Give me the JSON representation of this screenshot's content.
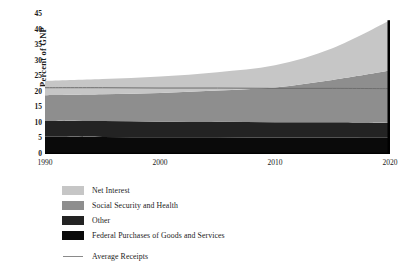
{
  "chart_data": {
    "type": "area",
    "stacked": true,
    "title": "",
    "xlabel": "",
    "ylabel": "Percent of GNP",
    "x": [
      1990,
      1995,
      2000,
      2005,
      2010,
      2015,
      2020
    ],
    "xlim": [
      1990,
      2020
    ],
    "ylim": [
      0,
      45
    ],
    "xticks": [
      "1990",
      "2000",
      "2010",
      "2020"
    ],
    "yticks": [
      "0",
      "5",
      "10",
      "15",
      "20",
      "25",
      "30",
      "35",
      "40",
      "45"
    ],
    "grid": false,
    "legend_position": "below",
    "series": [
      {
        "name": "Federal Purchases of Goods and Services",
        "color": "#0a0a0a",
        "values": [
          5.6,
          5.5,
          5.4,
          5.4,
          5.3,
          5.3,
          5.2
        ]
      },
      {
        "name": "Other",
        "color": "#232323",
        "values": [
          5.2,
          5.1,
          5.0,
          5.0,
          4.9,
          4.9,
          4.8
        ]
      },
      {
        "name": "Social Security and Health",
        "color": "#8e8e8e",
        "values": [
          8.1,
          8.6,
          9.2,
          10.0,
          11.2,
          13.6,
          16.8
        ]
      },
      {
        "name": "Net Interest",
        "color": "#c6c6c6",
        "values": [
          4.6,
          4.9,
          5.3,
          5.9,
          7.1,
          10.2,
          16.2
        ]
      }
    ],
    "totals": [
      23.5,
      24.1,
      24.9,
      26.3,
      28.5,
      34.0,
      43.0
    ],
    "reference_line": {
      "name": "Average Receipts",
      "color": "#6e6e6e",
      "values": [
        21.3,
        21.3,
        21.2,
        21.2,
        21.1,
        21.1,
        21.0
      ]
    }
  },
  "axes": {
    "y_title": "Percent of GNP",
    "y_ticks": [
      {
        "label": "45",
        "value": 45
      },
      {
        "label": "40",
        "value": 40
      },
      {
        "label": "35",
        "value": 35
      },
      {
        "label": "30",
        "value": 30
      },
      {
        "label": "25",
        "value": 25
      },
      {
        "label": "20",
        "value": 20
      },
      {
        "label": "15",
        "value": 15
      },
      {
        "label": "10",
        "value": 10
      },
      {
        "label": "5",
        "value": 5
      },
      {
        "label": "0",
        "value": 0
      }
    ],
    "x_ticks": [
      {
        "label": "1990",
        "value": 1990
      },
      {
        "label": "2000",
        "value": 2000
      },
      {
        "label": "2010",
        "value": 2010
      },
      {
        "label": "2020",
        "value": 2020
      }
    ]
  },
  "legend": {
    "items": [
      {
        "label": "Net Interest",
        "color": "#c6c6c6",
        "type": "swatch"
      },
      {
        "label": "Social Security and Health",
        "color": "#8e8e8e",
        "type": "swatch"
      },
      {
        "label": "Other",
        "color": "#232323",
        "type": "swatch"
      },
      {
        "label": "Federal Purchases of Goods and Services",
        "color": "#0a0a0a",
        "type": "swatch"
      },
      {
        "label": "Average Receipts",
        "color": "#8a8a8a",
        "type": "line"
      }
    ]
  }
}
